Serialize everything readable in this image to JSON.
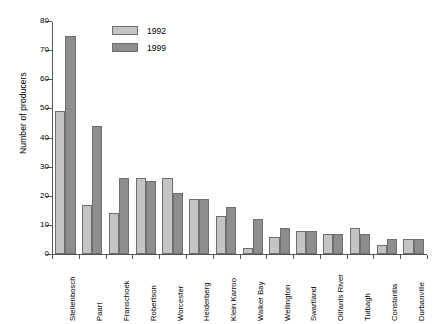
{
  "chart_data": {
    "type": "bar",
    "title": "",
    "xlabel": "",
    "ylabel": "Number of producers",
    "ylim": [
      0,
      80
    ],
    "ytick_step": 10,
    "yticks": [
      0,
      10,
      20,
      30,
      40,
      50,
      60,
      70,
      80
    ],
    "grid": false,
    "legend_position": "top-left-inside",
    "categories": [
      "Stellenbosch",
      "Paarl",
      "Franschoek",
      "Robertson",
      "Worcester",
      "Helderberg",
      "Klein Karroo",
      "Walker Bay",
      "Wellington",
      "Swartland",
      "Olifants River",
      "Tulbagh",
      "Constantia",
      "Durbanville"
    ],
    "series": [
      {
        "name": "1992",
        "color": "#c4c4c4",
        "values": [
          49,
          17,
          14,
          26,
          26,
          19,
          13,
          2,
          6,
          8,
          7,
          9,
          3,
          5
        ]
      },
      {
        "name": "1999",
        "color": "#8e8e8e",
        "values": [
          75,
          44,
          26,
          25,
          21,
          19,
          16,
          12,
          9,
          8,
          7,
          7,
          5,
          5
        ]
      }
    ]
  },
  "legend": {
    "items": [
      {
        "label": "1992"
      },
      {
        "label": "1999"
      }
    ]
  },
  "colors": {
    "series_1992": "#c4c4c4",
    "series_1999": "#8e8e8e",
    "axis": "#555555",
    "background": "#ffffff"
  }
}
